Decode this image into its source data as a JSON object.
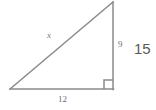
{
  "figure": {
    "type": "right-triangle-diagram",
    "stroke_color": "#8a8a8a",
    "background_color": "#ffffff",
    "stroke_width": 1.5,
    "vertices": {
      "left": [
        10,
        89
      ],
      "top": [
        113,
        2
      ],
      "corner": [
        113,
        89
      ]
    },
    "right_angle_marker": {
      "present": true,
      "size": 9,
      "at_vertex": "corner"
    }
  },
  "labels": {
    "hypotenuse": "x",
    "vertical_leg": "9",
    "base_leg": "12",
    "extra_value": "15"
  },
  "colors": {
    "line": "#8a8a8a",
    "small_text": "#6e6e6e",
    "large_text": "#595959",
    "background": "#ffffff"
  }
}
